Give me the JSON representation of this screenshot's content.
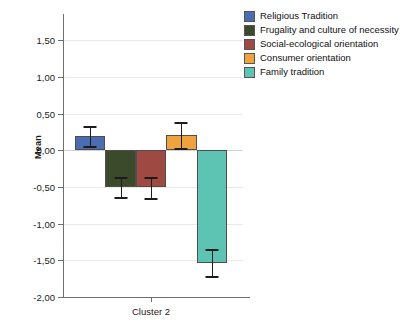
{
  "chart_data": {
    "type": "bar",
    "title": "",
    "subtitle": "",
    "xlabel": "",
    "ylabel": "Mean",
    "categories": [
      "Cluster 2"
    ],
    "ylim": [
      -2.0,
      1.75
    ],
    "ytick_values": [
      1.5,
      1.0,
      0.5,
      0.0,
      -0.5,
      -1.0,
      -1.5,
      -2.0
    ],
    "ytick_labels": [
      "1,50",
      "1,00",
      "0,50",
      "0,00",
      "-0,50",
      "-1,00",
      "-1,50",
      "-2,00"
    ],
    "grid": true,
    "legend_position": "right",
    "decimal_separator": ",",
    "error_bar_type": "95% CI",
    "series": [
      {
        "name": "Religious Tradition",
        "color": "#4a6cb0",
        "values": [
          0.19
        ],
        "error_low": [
          0.06
        ],
        "error_high": [
          0.33
        ]
      },
      {
        "name": "Frugality and culture of necessity",
        "color": "#3c4a2c",
        "values": [
          -0.5
        ],
        "error_low": [
          -0.64
        ],
        "error_high": [
          -0.37
        ]
      },
      {
        "name": "Social-ecological orientation",
        "color": "#9e4a42",
        "values": [
          -0.5
        ],
        "error_low": [
          -0.65
        ],
        "error_high": [
          -0.37
        ]
      },
      {
        "name": "Consumer orientation",
        "color": "#f0a33c",
        "values": [
          0.21
        ],
        "error_low": [
          0.03
        ],
        "error_high": [
          0.38
        ]
      },
      {
        "name": "Family tradition",
        "color": "#5dc4b4",
        "values": [
          -1.53
        ],
        "error_low": [
          -1.72
        ],
        "error_high": [
          -1.35
        ]
      }
    ]
  },
  "legend": {
    "items": [
      {
        "label": "Religious Tradition",
        "color": "#4a6cb0"
      },
      {
        "label": "Frugality and culture of necessity",
        "color": "#3c4a2c"
      },
      {
        "label": "Social-ecological orientation",
        "color": "#9e4a42"
      },
      {
        "label": "Consumer orientation",
        "color": "#f0a33c"
      },
      {
        "label": "Family tradition",
        "color": "#5dc4b4"
      }
    ]
  }
}
